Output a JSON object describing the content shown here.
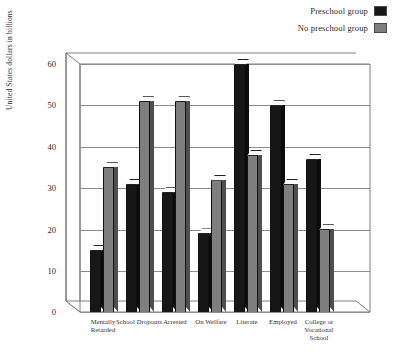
{
  "legend": {
    "items": [
      {
        "label": "Preschool group",
        "color": "#171717",
        "swatch_name": "legend-swatch-preschool"
      },
      {
        "label": "No preschool group",
        "color": "#7f7f7f",
        "swatch_name": "legend-swatch-no-preschool"
      }
    ]
  },
  "axes": {
    "ylabel": "United States dollars in billions",
    "yticks": [
      "0",
      "10",
      "20",
      "30",
      "40",
      "50",
      "60"
    ],
    "xlabel": ""
  },
  "chart_data": {
    "type": "bar",
    "title": "",
    "subtitle": "",
    "xlabel": "",
    "ylabel": "United States dollars in billions",
    "ylim": [
      0,
      60
    ],
    "ytick_step": 10,
    "grid": true,
    "legend_position": "top-right",
    "style": "3d-clustered-column",
    "categories": [
      "Mentally Retarded",
      "School Dropouts",
      "Arrested",
      "On Welfare",
      "Literate",
      "Employed",
      "College or Vocational School"
    ],
    "series": [
      {
        "name": "Preschool group",
        "color": "#171717",
        "values": [
          15,
          31,
          29,
          19,
          60,
          50,
          37
        ]
      },
      {
        "name": "No preschool group",
        "color": "#7f7f7f",
        "values": [
          35,
          51,
          51,
          32,
          38,
          31,
          20
        ]
      }
    ]
  }
}
